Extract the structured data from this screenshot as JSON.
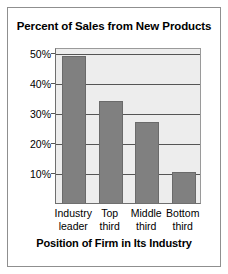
{
  "chart_data": {
    "type": "bar",
    "title": "Percent of Sales from New Products",
    "xlabel": "Position of Firm in Its Industry",
    "ylabel": "",
    "categories": [
      "Industry leader",
      "Top third",
      "Middle third",
      "Bottom third"
    ],
    "category_lines": [
      {
        "line1": "Industry",
        "line2": "leader"
      },
      {
        "line1": "Top",
        "line2": "third"
      },
      {
        "line1": "Middle",
        "line2": "third"
      },
      {
        "line1": "Bottom",
        "line2": "third"
      }
    ],
    "values": [
      49,
      34,
      27,
      10.5
    ],
    "ylim": [
      0,
      52
    ],
    "yticks": [
      10,
      20,
      30,
      40,
      50
    ],
    "ytick_labels": [
      "10%",
      "20%",
      "30%",
      "40%",
      "50%"
    ],
    "grid": true,
    "legend": "none",
    "colors": {
      "bar": "#808080",
      "plot_background": "#ededed",
      "gridline": "#555555",
      "axis": "#6f6f6f",
      "frame": "#8f8f8f",
      "text": "#000000",
      "page_background": "#ffffff"
    }
  }
}
